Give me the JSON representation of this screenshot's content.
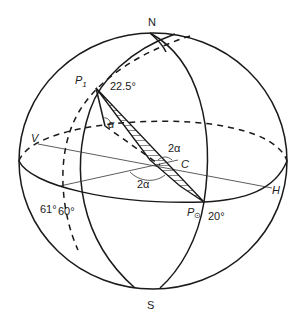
{
  "diagram": {
    "labels": {
      "north": "N",
      "south": "S",
      "p1": "P",
      "p1_sub": "1",
      "p_sun": "P",
      "p_sun_sub": "⊙",
      "vertex_v": "V",
      "vertex_h": "H",
      "center_c": "C",
      "angle_top": "22.5°",
      "angle_alpha": "α",
      "angle_2alpha_upper": "2α",
      "angle_2alpha_lower": "2α",
      "lat_61": "61°",
      "lat_60": "60°",
      "angle_20": "20°"
    },
    "colors": {
      "stroke": "#1a1a1a",
      "text": "#222222",
      "background": "#ffffff"
    }
  }
}
